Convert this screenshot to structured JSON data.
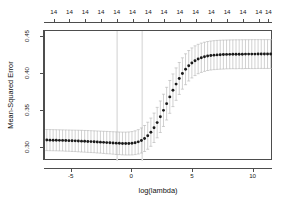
{
  "chart_data": {
    "type": "line",
    "title": "",
    "subtitle": "",
    "xlabel": "log(lambda)",
    "ylabel": "Mean-Squared Error",
    "xlim": [
      -7.2,
      11.6
    ],
    "ylim": [
      0.283,
      0.458
    ],
    "grid": false,
    "legend": null,
    "xticks": [
      -5,
      0,
      5,
      10
    ],
    "xtick_labels": [
      "-5",
      "0",
      "5",
      "10"
    ],
    "yticks": [
      0.3,
      0.35,
      0.4,
      0.45
    ],
    "ytick_labels": [
      "0.30",
      "0.35",
      "0.40",
      "0.45"
    ],
    "top_axis_label": "",
    "top_axis_ticks": [
      -6.4,
      -5.1,
      -3.8,
      -2.5,
      -1.2,
      0.1,
      1.4,
      2.7,
      4.0,
      5.3,
      6.6,
      7.9,
      9.2,
      10.5,
      11.3
    ],
    "top_axis_tick_labels": [
      "14",
      "14",
      "14",
      "14",
      "14",
      "14",
      "14",
      "14",
      "14",
      "14",
      "14",
      "14",
      "14",
      "14",
      "14"
    ],
    "vlines": [
      -1.25,
      0.82
    ],
    "series": [
      {
        "name": "Mean-Squared Error",
        "marker": "filled-circle",
        "color": "#1a1a1a",
        "errorbar_color": "#b4b4b4",
        "x": [
          -7.05,
          -6.79,
          -6.53,
          -6.27,
          -6.01,
          -5.75,
          -5.49,
          -5.23,
          -4.97,
          -4.71,
          -4.45,
          -4.19,
          -3.93,
          -3.67,
          -3.41,
          -3.15,
          -2.89,
          -2.63,
          -2.37,
          -2.11,
          -1.85,
          -1.59,
          -1.33,
          -1.07,
          -0.81,
          -0.55,
          -0.29,
          -0.03,
          0.23,
          0.49,
          0.75,
          1.01,
          1.27,
          1.53,
          1.79,
          2.05,
          2.31,
          2.57,
          2.83,
          3.09,
          3.35,
          3.61,
          3.87,
          4.13,
          4.39,
          4.65,
          4.91,
          5.17,
          5.43,
          5.69,
          5.95,
          6.21,
          6.47,
          6.73,
          6.99,
          7.25,
          7.51,
          7.77,
          8.03,
          8.29,
          8.55,
          8.81,
          9.07,
          9.33,
          9.59,
          9.85,
          10.11,
          10.37,
          10.63,
          10.89,
          11.15,
          11.41
        ],
        "y": [
          0.3112,
          0.3111,
          0.311,
          0.3109,
          0.3108,
          0.3107,
          0.3105,
          0.3104,
          0.3102,
          0.3101,
          0.3099,
          0.3097,
          0.3095,
          0.3093,
          0.3091,
          0.3089,
          0.3086,
          0.3084,
          0.3081,
          0.3078,
          0.3076,
          0.3073,
          0.307,
          0.3068,
          0.3066,
          0.3065,
          0.3066,
          0.3069,
          0.3076,
          0.3088,
          0.3106,
          0.3133,
          0.317,
          0.3218,
          0.3277,
          0.3347,
          0.3426,
          0.3512,
          0.3602,
          0.3693,
          0.3782,
          0.3865,
          0.3941,
          0.4008,
          0.4065,
          0.4112,
          0.415,
          0.418,
          0.4203,
          0.422,
          0.4233,
          0.4243,
          0.425,
          0.4255,
          0.4258,
          0.4261,
          0.4263,
          0.4265,
          0.4266,
          0.4267,
          0.4267,
          0.4268,
          0.4268,
          0.4269,
          0.4269,
          0.4269,
          0.4269,
          0.427,
          0.427,
          0.427,
          0.427,
          0.427
        ],
        "y_upper": [
          0.3254,
          0.3253,
          0.3252,
          0.3251,
          0.325,
          0.3249,
          0.3248,
          0.3247,
          0.3246,
          0.3245,
          0.3244,
          0.3243,
          0.3241,
          0.324,
          0.3238,
          0.3236,
          0.3234,
          0.3232,
          0.323,
          0.3228,
          0.3226,
          0.3224,
          0.3222,
          0.322,
          0.3219,
          0.3219,
          0.3221,
          0.3226,
          0.3236,
          0.3252,
          0.3275,
          0.3308,
          0.3352,
          0.3408,
          0.3475,
          0.3552,
          0.3638,
          0.3729,
          0.3822,
          0.3914,
          0.4002,
          0.4083,
          0.4156,
          0.4219,
          0.4273,
          0.4317,
          0.4352,
          0.438,
          0.4401,
          0.4417,
          0.4429,
          0.4438,
          0.4445,
          0.445,
          0.4453,
          0.4456,
          0.4458,
          0.4459,
          0.446,
          0.4461,
          0.4462,
          0.4462,
          0.4463,
          0.4463,
          0.4463,
          0.4464,
          0.4464,
          0.4464,
          0.4464,
          0.4464,
          0.4464,
          0.4464
        ],
        "y_lower": [
          0.297,
          0.2969,
          0.2968,
          0.2967,
          0.2966,
          0.2965,
          0.2962,
          0.2961,
          0.2958,
          0.2957,
          0.2954,
          0.2951,
          0.2949,
          0.2946,
          0.2944,
          0.2942,
          0.2938,
          0.2936,
          0.2932,
          0.2928,
          0.2926,
          0.2922,
          0.2918,
          0.2916,
          0.2913,
          0.2911,
          0.2911,
          0.2912,
          0.2916,
          0.2924,
          0.2937,
          0.2958,
          0.2988,
          0.3028,
          0.3079,
          0.3142,
          0.3214,
          0.3295,
          0.3382,
          0.3472,
          0.3562,
          0.3647,
          0.3726,
          0.3797,
          0.3857,
          0.3907,
          0.3948,
          0.398,
          0.4005,
          0.4023,
          0.4037,
          0.4048,
          0.4055,
          0.406,
          0.4063,
          0.4066,
          0.4068,
          0.4071,
          0.4072,
          0.4073,
          0.4072,
          0.4074,
          0.4073,
          0.4075,
          0.4075,
          0.4074,
          0.4074,
          0.4076,
          0.4076,
          0.4076,
          0.4076,
          0.4076
        ]
      }
    ]
  },
  "colors": {
    "axis": "#4d4d4d",
    "text": "#1a1a1a",
    "point": "#1a1a1a",
    "errorbar": "#b4b4b4",
    "vline": "#e2e2e2",
    "background": "#ffffff"
  }
}
